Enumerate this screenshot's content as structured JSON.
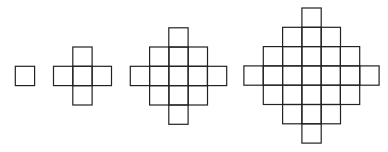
{
  "diagram": {
    "title": "",
    "cell_size": 19.3,
    "stroke_color": "#222222",
    "background": "#ffffff",
    "figures": [
      {
        "name": "figure-1",
        "cx": 25,
        "cy": 76,
        "row_counts": [
          1
        ]
      },
      {
        "name": "figure-2",
        "cx": 82.5,
        "cy": 76,
        "row_counts": [
          1,
          3,
          1
        ]
      },
      {
        "name": "figure-3",
        "cx": 178.5,
        "cy": 76,
        "row_counts": [
          1,
          3,
          5,
          3,
          1
        ]
      },
      {
        "name": "figure-4",
        "cx": 311.5,
        "cy": 75.5,
        "row_counts": [
          1,
          3,
          5,
          7,
          5,
          3,
          1
        ]
      }
    ]
  }
}
